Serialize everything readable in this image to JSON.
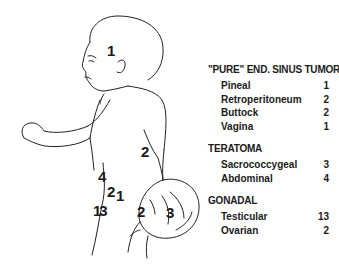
{
  "figure": {
    "site_labels": [
      {
        "id": "head",
        "value": "1",
        "x": 107,
        "y": 43
      },
      {
        "id": "back",
        "value": "2",
        "x": 141,
        "y": 144
      },
      {
        "id": "abdomen",
        "value": "4",
        "x": 98,
        "y": 169
      },
      {
        "id": "pelvis-2",
        "value": "2",
        "x": 108,
        "y": 186
      },
      {
        "id": "pelvis-1",
        "value": "1",
        "x": 117,
        "y": 190
      },
      {
        "id": "testis",
        "value": "13",
        "x": 94,
        "y": 204
      },
      {
        "id": "buttock",
        "value": "2",
        "x": 138,
        "y": 204
      },
      {
        "id": "sacrococcygeal",
        "value": "3",
        "x": 167,
        "y": 205
      }
    ]
  },
  "legend": {
    "groups": [
      {
        "title": "\"PURE\" END. SINUS TUMOR",
        "items": [
          {
            "label": "Pineal",
            "count": "1"
          },
          {
            "label": "Retroperitoneum",
            "count": "2"
          },
          {
            "label": "Buttock",
            "count": "2"
          },
          {
            "label": "Vagina",
            "count": "1"
          }
        ]
      },
      {
        "title": "TERATOMA",
        "items": [
          {
            "label": "Sacrococcygeal",
            "count": "3"
          },
          {
            "label": "Abdominal",
            "count": "4"
          }
        ]
      },
      {
        "title": "GONADAL",
        "items": [
          {
            "label": "Testicular",
            "count": "13"
          },
          {
            "label": "Ovarian",
            "count": "2"
          }
        ]
      }
    ]
  }
}
